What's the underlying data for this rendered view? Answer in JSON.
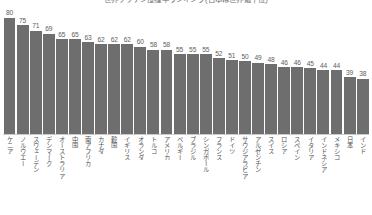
{
  "chart": {
    "title": "世界ワクチン接種率ランキング(日本は世界最下位)",
    "bar_color": "#6e6e6e",
    "value_label_color": "#5d5d5d",
    "category_label_color": "#545454",
    "baseline_color": "#c9c9c9"
  },
  "chart_data": {
    "type": "bar",
    "title": "世界ワクチン接種率ランキング(日本は世界最下位)",
    "xlabel": "",
    "ylabel": "",
    "ylim": [
      0,
      80
    ],
    "grid": false,
    "legend": false,
    "orientation": "vertical",
    "sort": "descending",
    "categories": [
      "ケニア",
      "ノルウエー",
      "スウェーデン",
      "デンマーク",
      "オーストラリア",
      "中国",
      "南アフリカ",
      "カナダ",
      "韓国",
      "イギリス",
      "オランダ",
      "トルコ",
      "アメリカ",
      "ベルギー",
      "ブラジル",
      "シンガポール",
      "フランス",
      "ドイツ",
      "サウジアラビア",
      "アルゼンチン",
      "スイス",
      "ロシア",
      "スペイン",
      "イタリア",
      "インドネシア",
      "メキシコ",
      "日本",
      "インド"
    ],
    "values": [
      80,
      75,
      71,
      69,
      65,
      65,
      63,
      62,
      62,
      62,
      60,
      58,
      58,
      55,
      55,
      55,
      52,
      51,
      50,
      49,
      48,
      46,
      46,
      45,
      44,
      44,
      39,
      38
    ]
  }
}
